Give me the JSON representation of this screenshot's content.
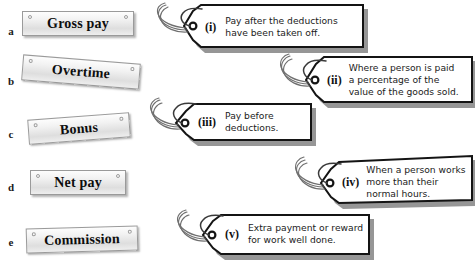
{
  "worksheet": {
    "title": "Payroll terms matching activity",
    "left_column": {
      "items": [
        {
          "letter": "a",
          "label": "Gross pay"
        },
        {
          "letter": "b",
          "label": "Overtime"
        },
        {
          "letter": "c",
          "label": "Bonus"
        },
        {
          "letter": "d",
          "label": "Net pay"
        },
        {
          "letter": "e",
          "label": "Commission"
        }
      ]
    },
    "right_column": {
      "items": [
        {
          "numeral": "(i)",
          "lines": [
            "Pay after the deductions",
            "have been taken off."
          ],
          "text": "Pay after the deductions have been taken off."
        },
        {
          "numeral": "(ii)",
          "lines": [
            "Where a person is paid",
            "a percentage of the",
            "value of the goods sold."
          ],
          "text": "Where a person is paid a percentage of the value of the goods sold."
        },
        {
          "numeral": "(iii)",
          "lines": [
            "Pay before",
            "deductions."
          ],
          "text": "Pay before deductions."
        },
        {
          "numeral": "(iv)",
          "lines": [
            "When a person works",
            "more than their",
            "normal hours."
          ],
          "text": "When a person works more than their normal hours."
        },
        {
          "numeral": "(v)",
          "lines": [
            "Extra payment or reward",
            "for work well done."
          ],
          "text": "Extra payment or reward for work well done."
        }
      ]
    },
    "colors": {
      "background": "#ffffff",
      "plate_border": "#9a9a9a",
      "plate_fill": "#eeeeee",
      "tag_outline": "#141414",
      "tag_shadow": "#8d8d8d",
      "string": "#6f6f6f",
      "text": "#111111"
    }
  }
}
